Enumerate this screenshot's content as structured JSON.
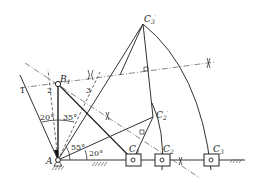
{
  "diagram": {
    "type": "linkage-synthesis",
    "points": {
      "A": {
        "label": "A",
        "x": 58,
        "y": 160
      },
      "B1": {
        "label": "B",
        "sub": "1",
        "x": 58,
        "y": 84
      },
      "C1": {
        "label": "C",
        "sub": "1",
        "x": 133,
        "y": 160
      },
      "C2": {
        "label": "C",
        "sub": "2",
        "x": 162,
        "y": 160
      },
      "C3": {
        "label": "C",
        "sub": "3",
        "x": 211,
        "y": 160
      },
      "C2p": {
        "label": "C",
        "sub": "2",
        "prime": "′",
        "x": 153,
        "y": 117
      },
      "C3p": {
        "label": "C",
        "sub": "3",
        "prime": "′",
        "x": 143,
        "y": 24
      }
    },
    "line_labels": [
      "1",
      "2",
      "3"
    ],
    "angles": [
      "20°",
      "35°",
      "55°",
      "20°"
    ]
  }
}
